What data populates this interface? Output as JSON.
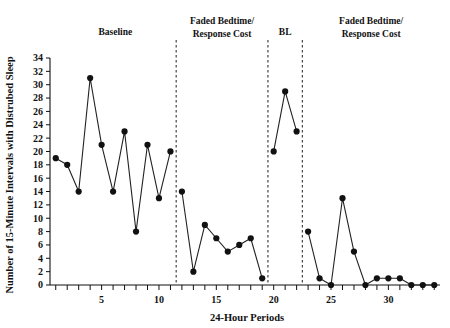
{
  "chart_data": {
    "type": "line",
    "title": "",
    "xlabel": "24-Hour Periods",
    "ylabel": "Number of 15-Minute Intervals with Distrubed Sleep",
    "xlim": [
      0.5,
      34.5
    ],
    "ylim": [
      0,
      34
    ],
    "ytick_step": 2,
    "yticks": [
      0,
      2,
      4,
      6,
      8,
      10,
      12,
      14,
      16,
      18,
      20,
      22,
      24,
      26,
      28,
      30,
      32,
      34
    ],
    "ytick_labels": [
      "0",
      "2",
      "4",
      "6",
      "8",
      "10",
      "12",
      "14",
      "16",
      "18",
      "20",
      "22",
      "24",
      "26",
      "28",
      "30",
      "32",
      "34"
    ],
    "xticks": [
      1,
      2,
      3,
      4,
      5,
      6,
      7,
      8,
      9,
      10,
      11,
      12,
      13,
      14,
      15,
      16,
      17,
      18,
      19,
      20,
      21,
      22,
      23,
      24,
      25,
      26,
      27,
      28,
      29,
      30,
      31,
      32,
      33,
      34
    ],
    "xtick_labels_shown": [
      "5",
      "10",
      "15",
      "20",
      "25",
      "30"
    ],
    "xtick_label_values": [
      5,
      10,
      15,
      20,
      25,
      30
    ],
    "grid": false,
    "legend": "none",
    "marker": "filled-circle",
    "segments": [
      {
        "phase": "Baseline",
        "x": [
          1,
          2,
          3,
          4,
          5,
          6,
          7,
          8,
          9,
          10,
          11
        ],
        "y": [
          19,
          18,
          14,
          31,
          21,
          14,
          23,
          8,
          21,
          13,
          20
        ]
      },
      {
        "phase": "Faded Bedtime/Response Cost",
        "x": [
          12,
          13,
          14,
          15,
          16,
          17,
          18,
          19
        ],
        "y": [
          14,
          2,
          9,
          7,
          5,
          6,
          7,
          1
        ]
      },
      {
        "phase": "BL",
        "x": [
          20,
          21,
          22
        ],
        "y": [
          20,
          29,
          23
        ]
      },
      {
        "phase": "Faded Bedtime/Response Cost",
        "x": [
          23,
          24,
          25,
          26,
          27,
          28,
          29,
          30,
          31,
          32,
          33,
          34
        ],
        "y": [
          8,
          1,
          0,
          13,
          5,
          0,
          1,
          1,
          1,
          0,
          0,
          0
        ]
      }
    ],
    "phase_dividers_x": [
      11.5,
      19.5,
      22.5
    ],
    "phase_labels": [
      {
        "text_lines": [
          "Baseline"
        ],
        "center_x": 6.2
      },
      {
        "text_lines": [
          "Faded Bedtime/",
          "Response Cost"
        ],
        "center_x": 15.5
      },
      {
        "text_lines": [
          "BL"
        ],
        "center_x": 21.0
      },
      {
        "text_lines": [
          "Faded Bedtime/",
          "Response Cost"
        ],
        "center_x": 28.5
      }
    ]
  },
  "labels": {
    "y_axis_title": "Number of 15-Minute Intervals with Distrubed Sleep",
    "x_axis_title": "24-Hour Periods",
    "phase_baseline": "Baseline",
    "phase_fbrc_1_line1": "Faded Bedtime/",
    "phase_fbrc_1_line2": "Response Cost",
    "phase_bl": "BL",
    "phase_fbrc_2_line1": "Faded Bedtime/",
    "phase_fbrc_2_line2": "Response Cost"
  },
  "colors": {
    "line": "#222222",
    "marker": "#111111",
    "axis": "#111111",
    "divider": "#333333",
    "background": "#ffffff"
  }
}
